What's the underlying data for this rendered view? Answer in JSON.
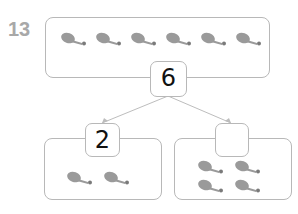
{
  "problem_number": "13",
  "whole": {
    "value": "6",
    "items": 6,
    "item_icon": "drumstick-icon"
  },
  "part_left": {
    "value": "2",
    "items": 2
  },
  "part_right": {
    "value": "",
    "items": 4
  },
  "colors": {
    "border": "#b8b8b8",
    "number": "#a8a8a8",
    "drumstick": "#9a9a9a"
  }
}
